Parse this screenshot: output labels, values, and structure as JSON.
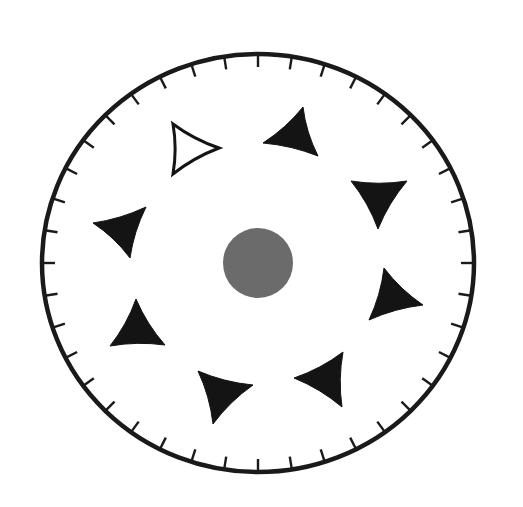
{
  "diagram": {
    "type": "circular-dial",
    "dial": {
      "center": [
        258,
        263
      ],
      "rx": 216,
      "ry": 209,
      "stroke_color": "#1a1a1a",
      "stroke_width": 4.5,
      "tick_count": 40,
      "tick_length": 13,
      "tick_width": 2.4
    },
    "center_dot": {
      "center": [
        258,
        263
      ],
      "radius": 35,
      "fill": "#6b6b6b"
    },
    "triangle_fill": "#141414",
    "triangles": [
      {
        "id": "t1",
        "filled": false,
        "points": [
          [
            173,
            124
          ],
          [
            219,
            148
          ],
          [
            173,
            174
          ]
        ]
      },
      {
        "id": "t2",
        "filled": true,
        "points": [
          [
            303,
            107
          ],
          [
            318,
            156
          ],
          [
            263,
            143
          ]
        ]
      },
      {
        "id": "t3",
        "filled": true,
        "points": [
          [
            351,
            181
          ],
          [
            407,
            181
          ],
          [
            378,
            229
          ]
        ]
      },
      {
        "id": "t4",
        "filled": true,
        "points": [
          [
            384,
            268
          ],
          [
            423,
            305
          ],
          [
            369,
            320
          ]
        ]
      },
      {
        "id": "t5",
        "filled": true,
        "points": [
          [
            343,
            352
          ],
          [
            342,
            407
          ],
          [
            294,
            378
          ]
        ]
      },
      {
        "id": "t6",
        "filled": true,
        "points": [
          [
            198,
            371
          ],
          [
            253,
            385
          ],
          [
            213,
            424
          ]
        ]
      },
      {
        "id": "t7",
        "filled": true,
        "points": [
          [
            136,
            299
          ],
          [
            165,
            345
          ],
          [
            110,
            346
          ]
        ]
      },
      {
        "id": "t8",
        "filled": true,
        "points": [
          [
            146,
            207
          ],
          [
            130,
            258
          ],
          [
            93,
            223
          ]
        ]
      }
    ]
  }
}
